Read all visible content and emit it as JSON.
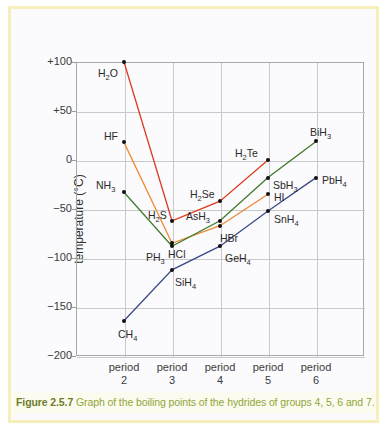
{
  "figure": {
    "caption_number": "Figure 2.5.7",
    "caption_text": "Graph of the boiling points of the hydrides of groups 4, 5, 6 and 7.",
    "frame_color": "#f7efb9",
    "caption_color": "#8fa63a"
  },
  "chart_data": {
    "type": "line",
    "title": "",
    "xlabel": "",
    "ylabel": "temperature (°C)",
    "x": [
      "period 2",
      "period 3",
      "period 4",
      "period 5",
      "period 6"
    ],
    "xtick_labels": [
      {
        "line1": "period",
        "line2": "2"
      },
      {
        "line1": "period",
        "line2": "3"
      },
      {
        "line1": "period",
        "line2": "4"
      },
      {
        "line1": "period",
        "line2": "5"
      },
      {
        "line1": "period",
        "line2": "6"
      }
    ],
    "ytick_labels": [
      "+100",
      "+50",
      "0",
      "−50",
      "−100",
      "−150",
      "−200"
    ],
    "ytick_values": [
      100,
      50,
      0,
      -50,
      -100,
      -150,
      -200
    ],
    "ylim": [
      -200,
      100
    ],
    "grid": true,
    "legend": "none",
    "series": [
      {
        "name": "group 6 hydrides",
        "color": "#e03c1f",
        "points": [
          {
            "x": "period 2",
            "y": 100,
            "label": "H₂O",
            "label_dx": -26,
            "label_dy": 12
          },
          {
            "x": "period 3",
            "y": -62,
            "label": "H₂S",
            "label_dx": -24,
            "label_dy": -5
          },
          {
            "x": "period 4",
            "y": -42,
            "label": "H₂Se",
            "label_dx": -30,
            "label_dy": -6
          },
          {
            "x": "period 5",
            "y": 0,
            "label": "H₂Te",
            "label_dx": -33,
            "label_dy": -6
          }
        ]
      },
      {
        "name": "group 7 hydrides",
        "color": "#ef8a33",
        "points": [
          {
            "x": "period 2",
            "y": 18,
            "label": "HF",
            "label_dx": -20,
            "label_dy": -5
          },
          {
            "x": "period 3",
            "y": -85,
            "label": "HCl",
            "label_dx": -4,
            "label_dy": 12
          },
          {
            "x": "period 4",
            "y": -67,
            "label": "HBr",
            "label_dx": 0,
            "label_dy": 13
          },
          {
            "x": "period 5",
            "y": -35,
            "label": "HI",
            "label_dx": 6,
            "label_dy": 4
          }
        ]
      },
      {
        "name": "group 5 hydrides",
        "color": "#3f7a29",
        "points": [
          {
            "x": "period 2",
            "y": -33,
            "label": "NH₃",
            "label_dx": -28,
            "label_dy": -6
          },
          {
            "x": "period 3",
            "y": -88,
            "label": "PH₃",
            "label_dx": -26,
            "label_dy": 12
          },
          {
            "x": "period 4",
            "y": -62,
            "label": "AsH₃",
            "label_dx": -34,
            "label_dy": -4
          },
          {
            "x": "period 5",
            "y": -18,
            "label": "SbH₃",
            "label_dx": 5,
            "label_dy": 8
          },
          {
            "x": "period 6",
            "y": 19,
            "label": "BiH₃",
            "label_dx": -6,
            "label_dy": -8
          }
        ]
      },
      {
        "name": "group 4 hydrides",
        "color": "#3a4a86",
        "points": [
          {
            "x": "period 2",
            "y": -164,
            "label": "CH₄",
            "label_dx": -6,
            "label_dy": 14
          },
          {
            "x": "period 3",
            "y": -112,
            "label": "SiH₄",
            "label_dx": 3,
            "label_dy": 13
          },
          {
            "x": "period 4",
            "y": -88,
            "label": "GeH₄",
            "label_dx": 5,
            "label_dy": 13
          },
          {
            "x": "period 5",
            "y": -52,
            "label": "SnH₄",
            "label_dx": 6,
            "label_dy": 9
          },
          {
            "x": "period 6",
            "y": -18,
            "label": "PbH₄",
            "label_dx": 6,
            "label_dy": 3
          }
        ]
      }
    ]
  }
}
